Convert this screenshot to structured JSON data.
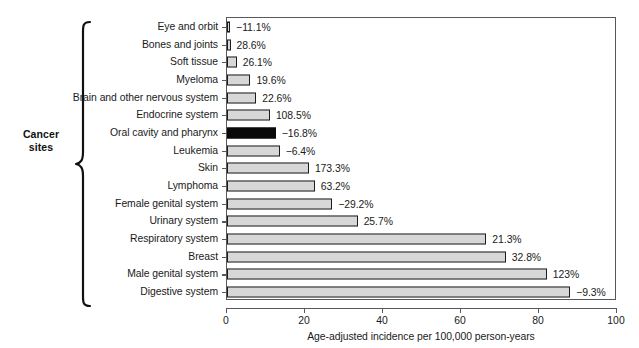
{
  "group": {
    "label_line1": "Cancer",
    "label_line2": "sites",
    "brace_icon": "curly-brace-icon"
  },
  "chart_data": {
    "type": "bar",
    "orientation": "horizontal",
    "title": "",
    "subtitle": "",
    "xlabel": "Age-adjusted incidence per 100,000 person-years",
    "ylabel": "Cancer sites",
    "xlim": [
      0,
      100
    ],
    "xticks": [
      0,
      20,
      40,
      60,
      80,
      100
    ],
    "xticklabels": [
      "0",
      "20",
      "40",
      "60",
      "80",
      "100"
    ],
    "grid": false,
    "legend": null,
    "categories": [
      "Eye and orbit",
      "Bones and joints",
      "Soft tissue",
      "Myeloma",
      "Brain and other nervous system",
      "Endocrine system",
      "Oral cavity and pharynx",
      "Leukemia",
      "Skin",
      "Lymphoma",
      "Female genital system",
      "Urinary system",
      "Respiratory system",
      "Breast",
      "Male genital system",
      "Digestive system"
    ],
    "values": [
      0.8,
      0.9,
      2.5,
      6.0,
      7.5,
      11.0,
      12.5,
      13.5,
      21.0,
      22.5,
      27.0,
      33.5,
      66.5,
      71.5,
      82.0,
      88.0
    ],
    "annotations": [
      "−11.1%",
      "28.6%",
      "26.1%",
      "19.6%",
      "22.6%",
      "108.5%",
      "−16.8%",
      "−6.4%",
      "173.3%",
      "63.2%",
      "−29.2%",
      "25.7%",
      "21.3%",
      "32.8%",
      "123%",
      "−9.3%"
    ],
    "bar_colors": [
      "#d7d7d7",
      "#d7d7d7",
      "#d7d7d7",
      "#d7d7d7",
      "#d7d7d7",
      "#d7d7d7",
      "#0a0a0a",
      "#d7d7d7",
      "#d7d7d7",
      "#d7d7d7",
      "#d7d7d7",
      "#d7d7d7",
      "#d7d7d7",
      "#d7d7d7",
      "#d7d7d7",
      "#d7d7d7"
    ],
    "bar_edge_color": "#1c1c1c",
    "axis_color": "#55595c",
    "text_color": "#1a1a1a",
    "annotation_note": "Percent labels at bar ends indicate change in incidence"
  }
}
